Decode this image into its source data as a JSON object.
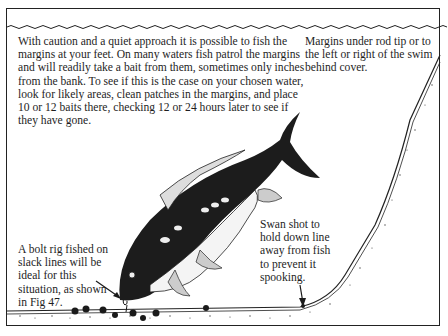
{
  "figure": {
    "type": "illustration",
    "colors": {
      "ink": "#1e1e1e",
      "paper": "#ffffff"
    }
  },
  "captions": {
    "main": "With caution and a quiet approach it is possible to fish the margins at your feet. On many waters fish patrol the margins and will readily take a bait from them, sometimes only inches from the bank. To see if this is the case on your chosen water, look for likely areas, clean patches in the margins, and place 10 or 12 baits there, checking 12 or 24 hours later to see if they have gone.",
    "margins": "Margins under rod tip or to the left or right of the swim behind cover.",
    "bolt_rig": "A bolt rig fished on slack lines will be ideal for this situation, as shown in Fig 47.",
    "swan_shot": "Swan shot to hold down line away from fish to prevent it spooking."
  }
}
